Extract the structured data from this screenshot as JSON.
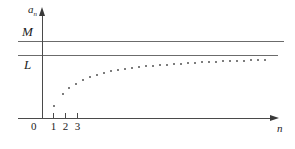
{
  "figure": {
    "title": "",
    "background_color": "#ffffff",
    "axis_color": "#4a4a4a",
    "line_color": "#6b6b6b",
    "dot_color": "#7d7d7d"
  },
  "labels": {
    "y_axis": "a",
    "y_axis_sub": "n",
    "x_axis": "n",
    "origin": "0",
    "upper_bound": "M",
    "limit": "L"
  },
  "ticks": {
    "x": [
      {
        "label": "1",
        "px": 53
      },
      {
        "label": "2",
        "px": 65
      },
      {
        "label": "3",
        "px": 77
      }
    ]
  },
  "chart_data": {
    "type": "scatter",
    "title": "",
    "xlabel": "n",
    "ylabel": "a_n",
    "grid": false,
    "legend": null,
    "annotations": [
      {
        "text": "M",
        "type": "horizontal-line",
        "y_px": 41,
        "note": "upper bound M"
      },
      {
        "text": "L",
        "type": "horizontal-line",
        "y_px": 55,
        "note": "limit L"
      }
    ],
    "axis_ranges": {
      "x_px": [
        42,
        273
      ],
      "y_px": [
        118,
        14
      ]
    },
    "series": [
      {
        "name": "a_n",
        "description": "increasing sequence converging upward to limit L from below, bounded above by M",
        "points_px": [
          {
            "x": 53,
            "y": 105
          },
          {
            "x": 62,
            "y": 93
          },
          {
            "x": 68,
            "y": 87
          },
          {
            "x": 75,
            "y": 83
          },
          {
            "x": 82,
            "y": 79
          },
          {
            "x": 89,
            "y": 76
          },
          {
            "x": 96,
            "y": 74
          },
          {
            "x": 103,
            "y": 72
          },
          {
            "x": 110,
            "y": 70
          },
          {
            "x": 117,
            "y": 69
          },
          {
            "x": 124,
            "y": 68
          },
          {
            "x": 131,
            "y": 67
          },
          {
            "x": 138,
            "y": 66
          },
          {
            "x": 145,
            "y": 65
          },
          {
            "x": 152,
            "y": 64.5
          },
          {
            "x": 159,
            "y": 64
          },
          {
            "x": 166,
            "y": 63.5
          },
          {
            "x": 173,
            "y": 63
          },
          {
            "x": 180,
            "y": 62.5
          },
          {
            "x": 187,
            "y": 62
          },
          {
            "x": 194,
            "y": 61.5
          },
          {
            "x": 201,
            "y": 61.2
          },
          {
            "x": 208,
            "y": 61
          },
          {
            "x": 215,
            "y": 60.6
          },
          {
            "x": 222,
            "y": 60.3
          },
          {
            "x": 229,
            "y": 60
          },
          {
            "x": 236,
            "y": 59.7
          },
          {
            "x": 243,
            "y": 59.5
          },
          {
            "x": 250,
            "y": 59.2
          },
          {
            "x": 257,
            "y": 59
          },
          {
            "x": 264,
            "y": 58.8
          }
        ]
      }
    ]
  }
}
